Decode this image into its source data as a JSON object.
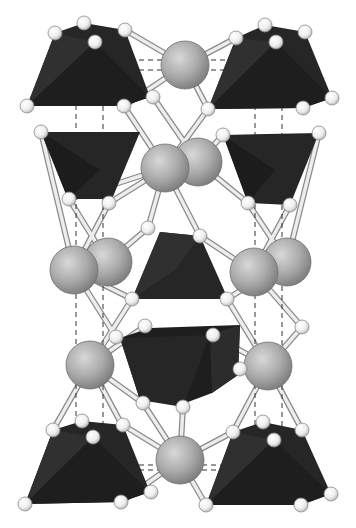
{
  "figure": {
    "type": "crystal-structure-polyhedral-model",
    "background": "#ffffff",
    "colors": {
      "polyhedron_fill": "#262626",
      "polyhedron_shade": "#1a1a1a",
      "polyhedron_light": "#333333",
      "cation_sphere": "#a8a8a8",
      "cation_highlight": "#d6d6d6",
      "cation_edge": "#6e6e6e",
      "anion_sphere": "#f2f2f2",
      "anion_edge": "#8a8a8a",
      "bond": "#e8e8e8",
      "bond_edge": "#8a8a8a",
      "unit_cell_line": "#333333"
    },
    "unit_cell": {
      "style": "dashed",
      "front_x": [
        76,
        255
      ],
      "back_x": [
        103,
        282
      ],
      "top_y": [
        60,
        70
      ],
      "bottom_y": [
        465,
        470
      ]
    },
    "cations": [
      {
        "x": 185,
        "y": 65,
        "r": 24
      },
      {
        "x": 198,
        "y": 162,
        "r": 24
      },
      {
        "x": 165,
        "y": 168,
        "r": 24
      },
      {
        "x": 108,
        "y": 262,
        "r": 24
      },
      {
        "x": 74,
        "y": 270,
        "r": 24
      },
      {
        "x": 287,
        "y": 262,
        "r": 24
      },
      {
        "x": 254,
        "y": 272,
        "r": 24
      },
      {
        "x": 90,
        "y": 365,
        "r": 24
      },
      {
        "x": 268,
        "y": 366,
        "r": 24
      },
      {
        "x": 180,
        "y": 460,
        "r": 24
      }
    ],
    "anions": [
      {
        "x": 55,
        "y": 33
      },
      {
        "x": 84,
        "y": 23
      },
      {
        "x": 95,
        "y": 42
      },
      {
        "x": 125,
        "y": 30
      },
      {
        "x": 27,
        "y": 106
      },
      {
        "x": 124,
        "y": 106
      },
      {
        "x": 153,
        "y": 97
      },
      {
        "x": 236,
        "y": 38
      },
      {
        "x": 265,
        "y": 25
      },
      {
        "x": 276,
        "y": 42
      },
      {
        "x": 305,
        "y": 32
      },
      {
        "x": 332,
        "y": 98
      },
      {
        "x": 303,
        "y": 108
      },
      {
        "x": 208,
        "y": 109
      },
      {
        "x": 41,
        "y": 132
      },
      {
        "x": 223,
        "y": 135
      },
      {
        "x": 319,
        "y": 133
      },
      {
        "x": 69,
        "y": 199
      },
      {
        "x": 109,
        "y": 203
      },
      {
        "x": 148,
        "y": 228
      },
      {
        "x": 200,
        "y": 236
      },
      {
        "x": 248,
        "y": 203
      },
      {
        "x": 290,
        "y": 205
      },
      {
        "x": 199,
        "y": 239
      },
      {
        "x": 132,
        "y": 299
      },
      {
        "x": 227,
        "y": 299
      },
      {
        "x": 145,
        "y": 326
      },
      {
        "x": 116,
        "y": 337
      },
      {
        "x": 213,
        "y": 335
      },
      {
        "x": 302,
        "y": 327
      },
      {
        "x": 240,
        "y": 369
      },
      {
        "x": 183,
        "y": 407
      },
      {
        "x": 143,
        "y": 403
      },
      {
        "x": 122,
        "y": 425
      },
      {
        "x": 53,
        "y": 430
      },
      {
        "x": 82,
        "y": 421
      },
      {
        "x": 93,
        "y": 437
      },
      {
        "x": 123,
        "y": 425
      },
      {
        "x": 25,
        "y": 504
      },
      {
        "x": 121,
        "y": 502
      },
      {
        "x": 151,
        "y": 492
      },
      {
        "x": 233,
        "y": 432
      },
      {
        "x": 263,
        "y": 422
      },
      {
        "x": 274,
        "y": 440
      },
      {
        "x": 302,
        "y": 430
      },
      {
        "x": 331,
        "y": 494
      },
      {
        "x": 301,
        "y": 505
      },
      {
        "x": 206,
        "y": 505
      }
    ]
  }
}
